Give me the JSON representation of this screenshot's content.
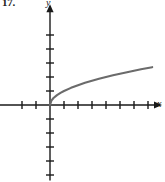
{
  "figure": {
    "problem_number": "17.",
    "y_axis_label": "y",
    "x_axis_label": "x",
    "axis_color": "#1a1a1a",
    "curve_color": "#6b6b6b",
    "background_color": "#ffffff"
  },
  "chart_data": {
    "type": "line",
    "title": "",
    "subtitle": "",
    "xlabel": "x",
    "ylabel": "y",
    "function": "y = sqrt(x)",
    "grid": false,
    "legend": null,
    "axis_arrows": [
      "x-positive",
      "y-positive"
    ],
    "origin_px": [
      50,
      105
    ],
    "unit_px": 14,
    "xlim": [
      -3.6,
      8.0
    ],
    "ylim": [
      -5.4,
      7.2
    ],
    "x_tick_values": [
      -2,
      -1,
      1,
      2,
      3,
      4,
      5,
      6,
      7
    ],
    "y_tick_values": [
      -5,
      -4,
      -3,
      -2,
      -1,
      1,
      2,
      3,
      4,
      5
    ],
    "x_tick_labels": [],
    "y_tick_labels": [],
    "series": [
      {
        "name": "y = sqrt(x)",
        "color": "#6b6b6b",
        "x": [
          0,
          0.1,
          0.25,
          0.5,
          0.75,
          1,
          1.5,
          2,
          2.5,
          3,
          3.5,
          4,
          4.5,
          5,
          5.5,
          6,
          6.5,
          7,
          7.3
        ],
        "y": [
          0,
          0.316,
          0.5,
          0.707,
          0.866,
          1,
          1.225,
          1.414,
          1.581,
          1.732,
          1.871,
          2,
          2.121,
          2.236,
          2.345,
          2.449,
          2.55,
          2.646,
          2.702
        ]
      }
    ],
    "annotations": []
  }
}
